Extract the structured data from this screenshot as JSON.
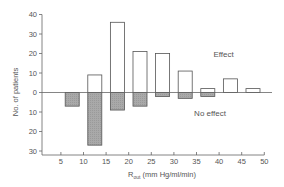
{
  "chart_data": {
    "type": "bar",
    "title": "",
    "xlabel": "R_out (mm Hg/ml/min)",
    "xlabel_main": "R",
    "xlabel_sub": "out",
    "xlabel_units": " (mm Hg/ml/min)",
    "ylabel": "No. of patients",
    "x_ticks": [
      5,
      10,
      15,
      20,
      25,
      30,
      35,
      40,
      45,
      50
    ],
    "y_ticks_up": [
      0,
      10,
      20,
      30,
      40
    ],
    "y_ticks_down": [
      10,
      20,
      30
    ],
    "xlim": [
      0,
      50
    ],
    "ylim": [
      -30,
      40
    ],
    "bins": [
      "5-10",
      "10-15",
      "15-20",
      "20-25",
      "25-30",
      "30-35",
      "35-40",
      "40-45",
      "45-50"
    ],
    "bin_starts": [
      5,
      10,
      15,
      20,
      25,
      30,
      35,
      40,
      45
    ],
    "series": [
      {
        "name": "Effect",
        "direction": "up",
        "fill": "#ffffff",
        "values": [
          0,
          9,
          36,
          21,
          20,
          11,
          2,
          7,
          2
        ]
      },
      {
        "name": "No effect",
        "direction": "down",
        "fill": "#a9a9a9",
        "values": [
          7,
          27,
          9,
          7,
          2,
          3,
          2,
          0,
          0
        ]
      }
    ],
    "annotations": [
      {
        "text": "Effect",
        "x": 41,
        "y": 18
      },
      {
        "text": "No effect",
        "x": 38,
        "y": -12
      }
    ],
    "grid": false,
    "legend": "none"
  },
  "colors": {
    "axis": "#666666",
    "bar_outline": "#555555",
    "effect_fill": "#ffffff",
    "no_effect_fill": "#a9a9a9"
  }
}
